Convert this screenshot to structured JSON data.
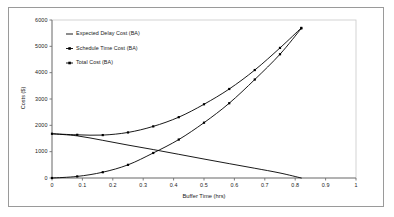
{
  "chart_data": {
    "type": "line",
    "title": "",
    "xlabel": "Buffer Time (hrs)",
    "ylabel": "Costs ($)",
    "xlim": [
      0,
      1
    ],
    "ylim": [
      0,
      6000
    ],
    "xticks": [
      "0",
      "0.1",
      "0.2",
      "0.3",
      "0.4",
      "0.5",
      "0.6",
      "0.7",
      "0.8",
      "0.9",
      "1"
    ],
    "xtick_values": [
      0,
      0.1,
      0.2,
      0.3,
      0.4,
      0.5,
      0.6,
      0.7,
      0.8,
      0.9,
      1
    ],
    "yticks": [
      "0",
      "1000",
      "2000",
      "3000",
      "4000",
      "5000",
      "6000"
    ],
    "ytick_values": [
      0,
      1000,
      2000,
      3000,
      4000,
      5000,
      6000
    ],
    "grid": false,
    "legend_position": "upper-left-inside",
    "series": [
      {
        "name": "Expected Delay Cost (BA)",
        "marker": "none",
        "color": "#000000",
        "x": [
          0,
          0.083,
          0.167,
          0.25,
          0.333,
          0.417,
          0.5,
          0.583,
          0.667,
          0.75,
          0.82
        ],
        "values": [
          1680,
          1600,
          1430,
          1250,
          1080,
          900,
          720,
          545,
          370,
          190,
          0
        ]
      },
      {
        "name": "Schedule Time Cost (BA)",
        "marker": "square",
        "color": "#000000",
        "x": [
          0,
          0.083,
          0.167,
          0.25,
          0.333,
          0.417,
          0.5,
          0.583,
          0.667,
          0.75,
          0.82
        ],
        "values": [
          0,
          60,
          220,
          500,
          950,
          1460,
          2100,
          2840,
          3740,
          4700,
          5680
        ]
      },
      {
        "name": "Total Cost (BA)",
        "marker": "square",
        "color": "#000000",
        "x": [
          0,
          0.083,
          0.167,
          0.25,
          0.333,
          0.417,
          0.5,
          0.583,
          0.667,
          0.75,
          0.82
        ],
        "values": [
          1680,
          1640,
          1630,
          1730,
          1960,
          2310,
          2800,
          3380,
          4100,
          4940,
          5700
        ]
      }
    ],
    "legend": [
      {
        "label": "Expected Delay Cost (BA)",
        "marker": "line"
      },
      {
        "label": "Schedule Time Cost (BA)",
        "marker": "line-square"
      },
      {
        "label": "Total Cost (BA)",
        "marker": "line-square"
      }
    ],
    "colors": {
      "series_line": "#000000",
      "axis": "#6f6f6f",
      "plot_border": "#c8c8c8",
      "frame_border": "#9a9a9a",
      "text": "#1a1a1a",
      "background": "#ffffff"
    }
  }
}
